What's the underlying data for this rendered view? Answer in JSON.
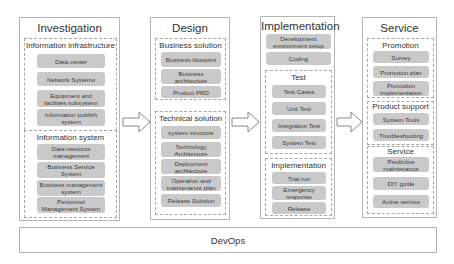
{
  "columns": [
    {
      "title": "Investigation",
      "groups": [
        {
          "title": "Information infrastructure",
          "items": [
            "Data center",
            "Network Systems",
            "Equipment and facilities subsystem",
            "Information publish system"
          ]
        },
        {
          "title": "Information system",
          "items": [
            "Data resource management",
            "Business Service System",
            "Business management system",
            "Personnel Management System"
          ]
        }
      ]
    },
    {
      "title": "Design",
      "groups": [
        {
          "title": "Business solution",
          "items": [
            "Business blueprint",
            "Business architecture",
            "Product PRD"
          ]
        },
        {
          "title": "Technical solution",
          "items": [
            "system structure",
            "Technology Architecture",
            "Deployment architecture",
            "Operation and maintenance plan",
            "Release Solution"
          ]
        }
      ]
    },
    {
      "title": "Implementation",
      "top_items": [
        "Development environment setup",
        "Coding"
      ],
      "groups": [
        {
          "title": "Test",
          "items": [
            "Test Cases",
            "Unit Test",
            "Integration Test",
            "System Test"
          ]
        },
        {
          "title": "Implementation",
          "items": [
            "Trial run",
            "Emergency response",
            "Release"
          ]
        }
      ]
    },
    {
      "title": "Service",
      "groups": [
        {
          "title": "Promotion",
          "items": [
            "Survey",
            "Promotion plan",
            "Promotion implementation"
          ]
        },
        {
          "title": "Product support",
          "items": [
            "System Tools",
            "Troubleshooting"
          ]
        },
        {
          "title": "Service",
          "items": [
            "Predictive maintenance",
            "DIY guide",
            "Active service"
          ]
        }
      ]
    }
  ],
  "footer": {
    "label": "DevOps"
  },
  "colors": {
    "item_fill": "#c9c9c9",
    "border": "#b5b5b5",
    "dashed_border": "#a8a8a8"
  }
}
